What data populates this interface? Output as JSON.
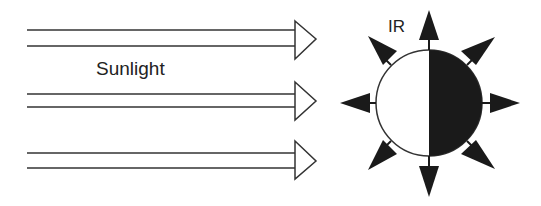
{
  "diagram": {
    "sunlight_label": "Sunlight",
    "ir_label": "IR",
    "colors": {
      "line": "#333333",
      "dark_side": "#1a1a1a",
      "background": "#ffffff"
    },
    "sunlight_rays": 3,
    "ir_arrows": 8
  }
}
